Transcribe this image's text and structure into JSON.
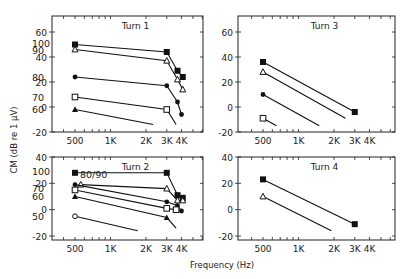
{
  "chart_data": {
    "type": "line",
    "xlabel": "Frequency (Hz)",
    "ylabel": "CM (dB re 1 μV)",
    "x_scale": "log",
    "x_ticks": [
      500,
      1000,
      2000,
      3000,
      4000
    ],
    "x_tick_labels": [
      "500",
      "1K",
      "2K",
      "3K",
      "4K"
    ],
    "xlim": [
      320,
      6200
    ],
    "panels": [
      {
        "title": "Turn 1",
        "position": "top-left",
        "ylim": [
          -20,
          73
        ],
        "y_ticks": [
          -20,
          0,
          20,
          40,
          60
        ],
        "y_tick_labels": [
          "-20",
          "0",
          "20",
          "40",
          "60"
        ],
        "series": [
          {
            "name": "100",
            "marker": "filled-square",
            "points": [
              [
                500,
                50
              ],
              [
                3000,
                44
              ],
              [
                3700,
                29
              ],
              [
                4100,
                24
              ]
            ]
          },
          {
            "name": "90",
            "marker": "open-triangle",
            "points": [
              [
                500,
                46
              ],
              [
                3000,
                37
              ],
              [
                3700,
                22
              ],
              [
                4100,
                14
              ]
            ]
          },
          {
            "name": "80",
            "marker": "filled-circle",
            "points": [
              [
                500,
                24
              ],
              [
                3000,
                17
              ],
              [
                3700,
                4
              ],
              [
                4000,
                -6
              ]
            ]
          },
          {
            "name": "70",
            "marker": "open-square",
            "points": [
              [
                500,
                8
              ],
              [
                3000,
                -2
              ],
              [
                3600,
                -14,
                "end"
              ]
            ]
          },
          {
            "name": "60",
            "marker": "filled-triangle",
            "points": [
              [
                500,
                -2
              ],
              [
                2300,
                -14,
                "end"
              ]
            ]
          }
        ]
      },
      {
        "title": "Turn 3",
        "position": "top-right",
        "ylim": [
          -20,
          73
        ],
        "y_ticks": [
          -20,
          0,
          20,
          40,
          60
        ],
        "y_tick_labels": [
          "-20",
          "0",
          "20",
          "40",
          "60"
        ],
        "series": [
          {
            "name": "",
            "marker": "filled-square",
            "points": [
              [
                500,
                36
              ],
              [
                3000,
                -4
              ]
            ]
          },
          {
            "name": "",
            "marker": "open-triangle",
            "points": [
              [
                500,
                28
              ],
              [
                2500,
                -9,
                "end"
              ]
            ]
          },
          {
            "name": "",
            "marker": "filled-circle",
            "points": [
              [
                500,
                10
              ],
              [
                1500,
                -15,
                "end"
              ]
            ]
          },
          {
            "name": "",
            "marker": "open-square",
            "points": [
              [
                500,
                -9
              ],
              [
                650,
                -15,
                "end"
              ]
            ]
          }
        ]
      },
      {
        "title": "Turn 2",
        "position": "bottom-left",
        "ylim": [
          -23,
          40
        ],
        "y_ticks": [
          -20,
          0,
          20,
          40
        ],
        "y_tick_labels": [
          "-20",
          "0",
          "20",
          "40"
        ],
        "series": [
          {
            "name": "100",
            "marker": "filled-square",
            "points": [
              [
                500,
                28
              ],
              [
                3000,
                28
              ],
              [
                3700,
                11
              ],
              [
                4100,
                9
              ]
            ]
          },
          {
            "name": "80/90",
            "marker": "open-triangle",
            "points": [
              [
                560,
                19
              ],
              [
                3000,
                16
              ],
              [
                3700,
                7
              ],
              [
                4100,
                7
              ]
            ]
          },
          {
            "name": "80/90",
            "marker": "filled-circle",
            "points": [
              [
                500,
                19
              ],
              [
                3000,
                6
              ],
              [
                3700,
                3
              ],
              [
                4000,
                -1
              ]
            ]
          },
          {
            "name": "70",
            "marker": "open-square",
            "points": [
              [
                500,
                15
              ],
              [
                3000,
                1
              ],
              [
                3600,
                0
              ]
            ]
          },
          {
            "name": "60",
            "marker": "filled-triangle",
            "points": [
              [
                500,
                10
              ],
              [
                3000,
                -6
              ],
              [
                3600,
                -14,
                "end"
              ]
            ]
          },
          {
            "name": "50",
            "marker": "open-circle",
            "points": [
              [
                500,
                -5
              ],
              [
                1700,
                -16,
                "end"
              ]
            ]
          }
        ]
      },
      {
        "title": "Turn 4",
        "position": "bottom-right",
        "ylim": [
          -23,
          40
        ],
        "y_ticks": [
          -20,
          0,
          20,
          40
        ],
        "y_tick_labels": [
          "-20",
          "0",
          "20",
          "40"
        ],
        "series": [
          {
            "name": "",
            "marker": "filled-square",
            "points": [
              [
                500,
                23
              ],
              [
                3000,
                -11
              ]
            ]
          },
          {
            "name": "",
            "marker": "open-triangle",
            "points": [
              [
                500,
                10
              ],
              [
                1900,
                -16,
                "end"
              ]
            ]
          }
        ]
      }
    ],
    "grid": false,
    "legend": "inline level labels at left of each series (dB SPL)"
  },
  "level_labels": {
    "turn1": [
      "100",
      "90",
      "80",
      "70",
      "60"
    ],
    "turn2": [
      "100",
      "80/90",
      "70",
      "60",
      "50"
    ]
  }
}
